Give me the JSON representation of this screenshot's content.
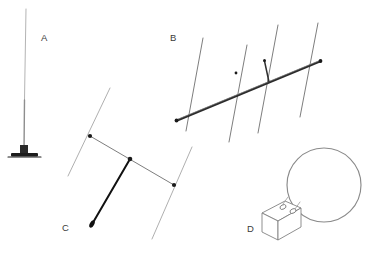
{
  "figure": {
    "background_color": "#ffffff",
    "width": 369,
    "height": 257,
    "labels": [
      {
        "id": "A",
        "text": "A",
        "x": 41,
        "y": 41,
        "subject": "vertical whip antenna with ground base"
      },
      {
        "id": "B",
        "text": "B",
        "x": 170,
        "y": 41,
        "subject": "multi-element yagi beam antenna"
      },
      {
        "id": "C",
        "text": "C",
        "x": 62,
        "y": 231,
        "subject": "two-element beam antenna with feedline"
      },
      {
        "id": "D",
        "text": "D",
        "x": 247,
        "y": 232,
        "subject": "loop antenna with tuning box"
      }
    ],
    "colors": {
      "thin_line": "#9a9a9a",
      "mid_line": "#6e6e6e",
      "dark_line": "#303030",
      "boom": "#2b2b2b",
      "feed": "#111111",
      "node": "#1a1a1a",
      "label_text": "#3a3a3a"
    },
    "antenna_a": {
      "name": "vertical-whip",
      "mast_top_x": 26,
      "mast_top_y": 9,
      "mast_bottom_x": 24,
      "mast_bottom_y": 152,
      "base_plate_x": 12,
      "base_plate_y": 153,
      "base_plate_width": 26,
      "base_plate_height": 4
    },
    "antenna_b": {
      "name": "yagi-beam",
      "boom_start_x": 176,
      "boom_start_y": 121,
      "boom_end_x": 321,
      "boom_end_y": 61,
      "element_count": 4,
      "elements": [
        {
          "index": 1,
          "role": "reflector",
          "x1": 203,
          "y1": 38,
          "x2": 186,
          "y2": 131
        },
        {
          "index": 2,
          "role": "driven",
          "x1": 247,
          "y1": 45,
          "x2": 229,
          "y2": 142
        },
        {
          "index": 3,
          "role": "director-1",
          "x1": 278,
          "y1": 25,
          "x2": 258,
          "y2": 133
        },
        {
          "index": 4,
          "role": "director-2",
          "x1": 318,
          "y1": 23,
          "x2": 300,
          "y2": 117
        }
      ],
      "feed_stub": {
        "x1": 264,
        "y1": 62,
        "x2": 269,
        "y2": 81
      }
    },
    "antenna_c": {
      "name": "two-element-beam",
      "boom_start_x": 90,
      "boom_start_y": 136,
      "boom_end_x": 174,
      "boom_end_y": 185,
      "element_count": 2,
      "elements": [
        {
          "index": 1,
          "role": "reflector",
          "x1": 110,
          "y1": 88,
          "x2": 68,
          "y2": 176
        },
        {
          "index": 2,
          "role": "driven",
          "x1": 192,
          "y1": 147,
          "x2": 152,
          "y2": 239
        }
      ],
      "feedline": {
        "x1": 130,
        "y1": 160,
        "x2": 91,
        "y2": 226
      }
    },
    "antenna_d": {
      "name": "loop-antenna",
      "loop_center_x": 324,
      "loop_center_y": 185,
      "loop_radius_x": 37,
      "loop_radius_y": 37,
      "box_x": 262,
      "box_y": 203,
      "box_width": 38,
      "box_height": 26
    }
  }
}
